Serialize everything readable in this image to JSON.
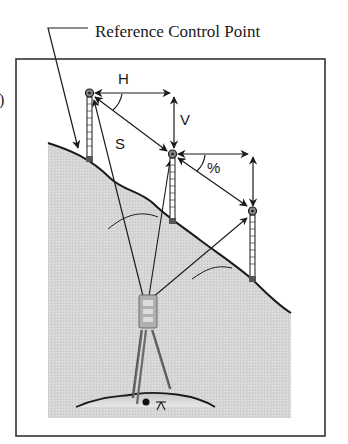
{
  "figure": {
    "title_label": "Reference Control Point",
    "panel_marker": "c)",
    "labels": {
      "horizontal": "H",
      "vertical": "V",
      "slope": "S",
      "grade": "%"
    },
    "colors": {
      "frame": "#333333",
      "ink": "#1a1a1a",
      "ground_fill": "#d4d4d4",
      "background": "#ffffff"
    },
    "elements": {
      "rods": [
        {
          "name": "reference-rod",
          "prism": [
            89,
            93
          ],
          "base": [
            90,
            161
          ]
        },
        {
          "name": "middle-rod",
          "prism": [
            172,
            154
          ],
          "base": [
            174,
            222
          ]
        },
        {
          "name": "lower-rod",
          "prism": [
            252,
            211
          ],
          "base": [
            254,
            280
          ]
        }
      ],
      "instrument": {
        "name": "total-station",
        "position": [
          148,
          300
        ]
      }
    }
  }
}
